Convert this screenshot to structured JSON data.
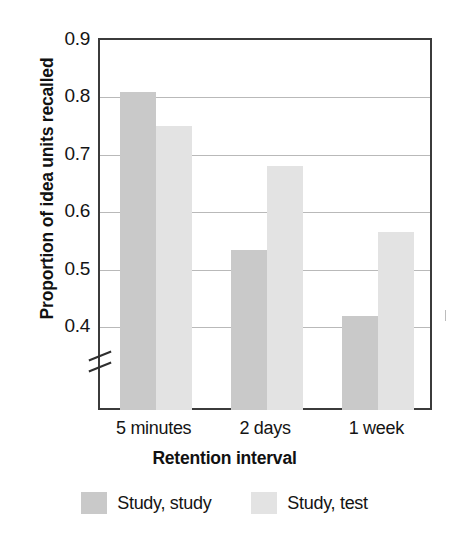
{
  "chart_data": {
    "type": "bar",
    "title": "",
    "xlabel": "Retention interval",
    "ylabel": "Proportion of idea units recalled",
    "categories": [
      "5 minutes",
      "2 days",
      "1 week"
    ],
    "series": [
      {
        "name": "Study, study",
        "color": "#c9c9c9",
        "values": [
          0.81,
          0.535,
          0.42
        ]
      },
      {
        "name": "Study, test",
        "color": "#e3e3e3",
        "values": [
          0.75,
          0.68,
          0.565
        ]
      }
    ],
    "yticks": [
      0.4,
      0.5,
      0.6,
      0.7,
      0.8,
      0.9
    ],
    "ytick_labels": [
      "0.4",
      "0.5",
      "0.6",
      "0.7",
      "0.8",
      "0.9"
    ],
    "ylim": [
      0.4,
      0.9
    ],
    "y_axis_break": true,
    "grid": true,
    "legend_position": "bottom",
    "axis_color": "#3b3b3b",
    "gridline_color": "#b9b9b9"
  },
  "axis": {
    "ylabel": "Proportion of idea units recalled",
    "xlabel": "Retention interval"
  }
}
